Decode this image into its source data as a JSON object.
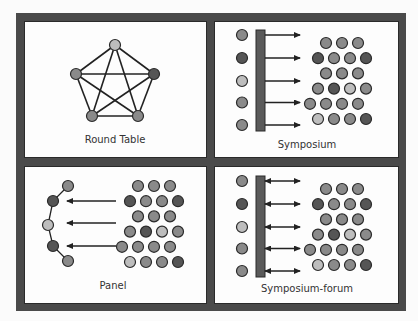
{
  "colors": {
    "frame": "#4a4a4a",
    "panel_bg": "#fdfdfd",
    "bar": "#5a5a5a",
    "line": "#222222",
    "node_light": "#bdbdbd",
    "node_mid": "#8a8a8a",
    "node_dark": "#555555"
  },
  "panels": [
    {
      "id": "round-table",
      "label": "Round Table"
    },
    {
      "id": "symposium",
      "label": "Symposium"
    },
    {
      "id": "panel",
      "label": "Panel"
    },
    {
      "id": "symposium-forum",
      "label": "Symposium-forum"
    }
  ],
  "round_table": {
    "nodes": [
      {
        "x": 115,
        "y": 45,
        "shade": "light"
      },
      {
        "x": 154,
        "y": 74,
        "shade": "dark"
      },
      {
        "x": 138,
        "y": 116,
        "shade": "mid"
      },
      {
        "x": 92,
        "y": 116,
        "shade": "mid"
      },
      {
        "x": 76,
        "y": 74,
        "shade": "mid"
      }
    ]
  },
  "speakers_column": [
    "mid",
    "dark",
    "light",
    "mid",
    "mid"
  ],
  "panel_arc": [
    "mid",
    "dark",
    "light",
    "dark",
    "mid"
  ],
  "audience_rows": [
    {
      "offset": 1,
      "shades": [
        "mid",
        "mid",
        "mid"
      ]
    },
    {
      "offset": 0.5,
      "shades": [
        "dark",
        "mid",
        "mid",
        "dark"
      ]
    },
    {
      "offset": 1,
      "shades": [
        "mid",
        "mid",
        "mid"
      ]
    },
    {
      "offset": 0.5,
      "shades": [
        "mid",
        "dark",
        "light",
        "mid"
      ]
    },
    {
      "offset": 0,
      "shades": [
        "mid",
        "mid",
        "mid",
        "mid"
      ]
    },
    {
      "offset": 0.5,
      "shades": [
        "light",
        "mid",
        "mid",
        "dark"
      ]
    }
  ]
}
